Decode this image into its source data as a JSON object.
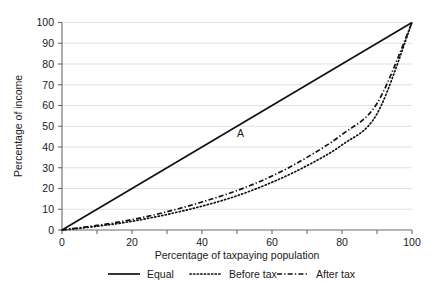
{
  "chart_data": {
    "type": "line",
    "title": "",
    "subtitle": "",
    "xlabel": "Percentage of taxpaying population",
    "ylabel": "Percentage of income",
    "xlim": [
      0,
      100
    ],
    "ylim": [
      0,
      100
    ],
    "grid": "horizontal",
    "legend_position": "bottom",
    "x_ticks": [
      0,
      10,
      20,
      30,
      40,
      50,
      60,
      70,
      80,
      90,
      100
    ],
    "x_tick_labels": [
      "0",
      "",
      "20",
      "",
      "40",
      "",
      "60",
      "",
      "80",
      "",
      "100"
    ],
    "y_ticks": [
      0,
      10,
      20,
      30,
      40,
      50,
      60,
      70,
      80,
      90,
      100
    ],
    "y_tick_labels": [
      "0",
      "10",
      "20",
      "30",
      "40",
      "50",
      "60",
      "70",
      "80",
      "90",
      "100"
    ],
    "x": [
      0,
      10,
      20,
      30,
      40,
      50,
      60,
      70,
      80,
      90,
      100
    ],
    "series": [
      {
        "name": "Equal",
        "style": "solid",
        "color": "#111111",
        "values": [
          0,
          10,
          20,
          30,
          40,
          50,
          60,
          70,
          80,
          90,
          100
        ]
      },
      {
        "name": "Before tax",
        "style": "dotted",
        "color": "#111111",
        "values": [
          0,
          1.8,
          4.2,
          7.5,
          11.5,
          16.5,
          23,
          31,
          41,
          56,
          100
        ]
      },
      {
        "name": "After tax",
        "style": "dash-dot",
        "color": "#111111",
        "values": [
          0,
          2.2,
          5.0,
          8.8,
          13.5,
          19.0,
          26,
          35,
          46,
          61,
          100
        ]
      }
    ],
    "annotations": [
      {
        "text": "A",
        "x": 51,
        "y": 45
      }
    ]
  },
  "axes": {
    "x_title": "Percentage of taxpaying population",
    "y_title": "Percentage of income"
  },
  "legend": {
    "items": [
      {
        "label": "Equal"
      },
      {
        "label": "Before tax"
      },
      {
        "label": "After tax"
      }
    ]
  }
}
